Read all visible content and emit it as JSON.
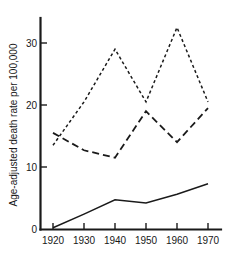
{
  "chart_data": {
    "type": "line",
    "title": "",
    "xlabel": "",
    "ylabel": "Age-adjusted death rate per 100,000",
    "x": [
      1920,
      1930,
      1940,
      1950,
      1960,
      1970
    ],
    "xtick_labels": [
      "1920",
      "1930",
      "1940",
      "1950",
      "1960",
      "1970"
    ],
    "ytick_labels": [
      "0",
      "10",
      "20",
      "30"
    ],
    "ytick_values": [
      0,
      10,
      20,
      30
    ],
    "xlim": [
      1920,
      1970
    ],
    "ylim": [
      0,
      33
    ],
    "grid": false,
    "legend": "none",
    "series": [
      {
        "name": "short-dashed-series",
        "style": "short-dashed",
        "color": "#1a1a1a",
        "values": [
          13.5,
          20.5,
          29.0,
          20.5,
          32.5,
          20.5
        ]
      },
      {
        "name": "long-dashed-series",
        "style": "long-dashed",
        "color": "#1a1a1a",
        "values": [
          15.5,
          12.7,
          11.5,
          19.0,
          14.0,
          19.5
        ]
      },
      {
        "name": "solid-series",
        "style": "solid",
        "color": "#1a1a1a",
        "values": [
          0.2,
          2.4,
          4.7,
          4.2,
          5.6,
          7.3
        ]
      }
    ]
  }
}
